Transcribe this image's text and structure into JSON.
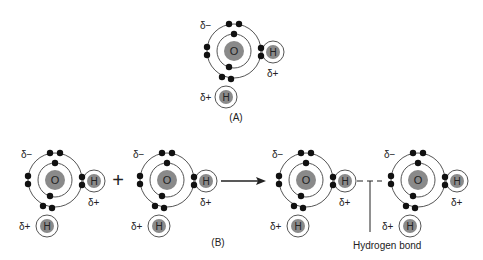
{
  "figure": {
    "panel_a": {
      "label": "(A)",
      "molecule": {
        "center": [
          234,
          51
        ],
        "atoms": {
          "oxygen": "O",
          "hydrogen_right": "H",
          "hydrogen_bottom": "H"
        },
        "charges": {
          "oxygen": "δ−",
          "hydrogen_right": "δ+",
          "hydrogen_bottom": "δ+"
        }
      }
    },
    "panel_b": {
      "label": "(B)",
      "plus_sign": "+",
      "molecules": [
        {
          "center": [
            55,
            180
          ],
          "atoms": {
            "oxygen": "O",
            "hydrogen_right": "H",
            "hydrogen_bottom": "H"
          },
          "charges": {
            "oxygen": "δ−",
            "hydrogen_right": "δ+",
            "hydrogen_bottom": "δ+"
          }
        },
        {
          "center": [
            167,
            180
          ],
          "atoms": {
            "oxygen": "O",
            "hydrogen_right": "H",
            "hydrogen_bottom": "H"
          },
          "charges": {
            "oxygen": "δ−",
            "hydrogen_right": "δ+",
            "hydrogen_bottom": "δ+"
          }
        },
        {
          "center": [
            306,
            180
          ],
          "atoms": {
            "oxygen": "O",
            "hydrogen_right": "H",
            "hydrogen_bottom": "H"
          },
          "charges": {
            "oxygen": "δ−",
            "hydrogen_right": "δ+",
            "hydrogen_bottom": "δ+"
          }
        },
        {
          "center": [
            418,
            180
          ],
          "atoms": {
            "oxygen": "O",
            "hydrogen_right": "H",
            "hydrogen_bottom": "H"
          },
          "charges": {
            "oxygen": "δ−",
            "hydrogen_right": "δ+",
            "hydrogen_bottom": "δ+"
          }
        }
      ],
      "arrow": "reaction-arrow",
      "annotation": "Hydrogen bond"
    },
    "colors": {
      "nucleus": "#8a8a8a",
      "electron": "#111111",
      "orbit": "#555555",
      "text": "#222222"
    }
  }
}
